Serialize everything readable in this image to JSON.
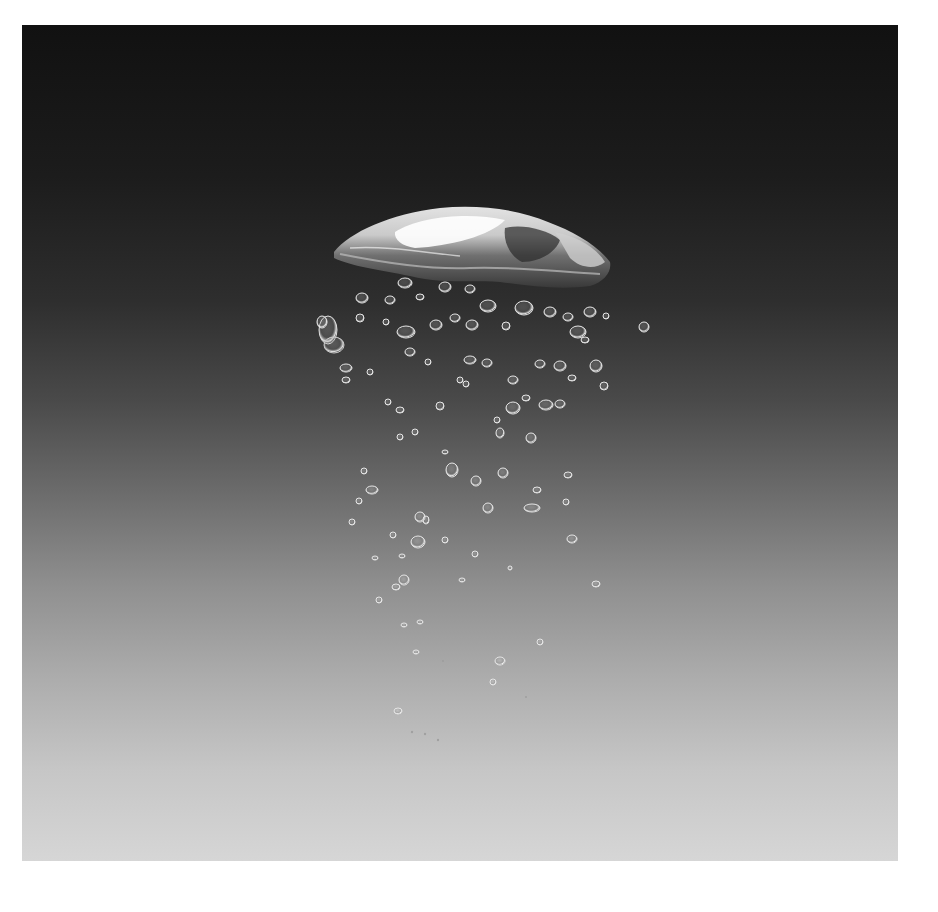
{
  "image": {
    "subject": "Air bubbles rising through water against a dark-to-light gray gradient background",
    "alt": "Large dome-shaped bubble at top with a trail of smaller bubbles below",
    "background_gradient": {
      "top": "#111111",
      "middle": "#6f6f6f",
      "bottom": "#d6d6d6"
    },
    "border_color": "#ffffff"
  },
  "main_bubble": {
    "cx": 450,
    "cy": 220,
    "label": "large-bubble"
  }
}
